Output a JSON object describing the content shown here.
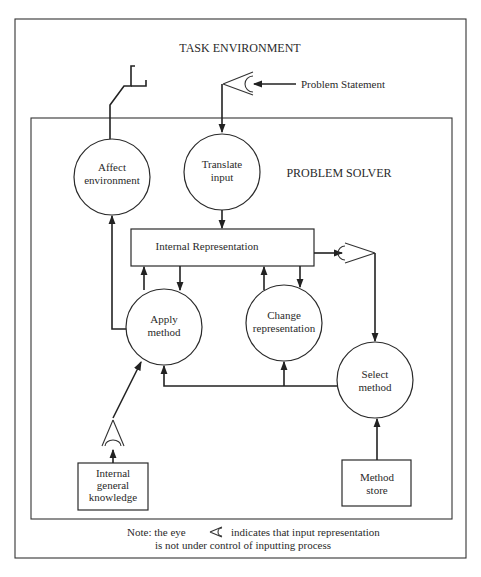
{
  "diagram": {
    "outer_label": "TASK ENVIRONMENT",
    "inner_label": "PROBLEM SOLVER",
    "input_label": "Problem Statement",
    "nodes": {
      "affect": {
        "line1": "Affect",
        "line2": "environment"
      },
      "translate": {
        "line1": "Translate",
        "line2": "input"
      },
      "internal_rep": {
        "label": "Internal Representation"
      },
      "apply": {
        "line1": "Apply",
        "line2": "method"
      },
      "change": {
        "line1": "Change",
        "line2": "representation"
      },
      "select": {
        "line1": "Select",
        "line2": "method"
      },
      "knowledge": {
        "line1": "Internal",
        "line2": "general",
        "line3": "knowledge"
      },
      "store": {
        "line1": "Method",
        "line2": "store"
      }
    },
    "edges": [
      {
        "from": "Problem Statement",
        "to": "eye (top)"
      },
      {
        "from": "eye (top)",
        "to": "Translate input"
      },
      {
        "from": "Translate input",
        "to": "Internal Representation"
      },
      {
        "from": "Internal Representation",
        "to": "Apply method"
      },
      {
        "from": "Apply method",
        "to": "Internal Representation"
      },
      {
        "from": "Internal Representation",
        "to": "Change representation"
      },
      {
        "from": "Change representation",
        "to": "Internal Representation"
      },
      {
        "from": "Internal Representation",
        "to": "eye (right)"
      },
      {
        "from": "eye (right)",
        "to": "Select method"
      },
      {
        "from": "Select method",
        "to": "Apply method"
      },
      {
        "from": "Select method",
        "to": "Change representation"
      },
      {
        "from": "Method store",
        "to": "Select method"
      },
      {
        "from": "Internal general knowledge",
        "to": "eye (bottom-left)"
      },
      {
        "from": "eye (bottom-left)",
        "to": "Apply method"
      },
      {
        "from": "Apply method",
        "to": "Affect environment"
      },
      {
        "from": "Affect environment",
        "to": "Task environment (effector)"
      }
    ],
    "note": {
      "prefix": "Note: the eye",
      "suffix": "indicates that input representation",
      "line2": "is not under control of inputting process",
      "icon": "eye-icon"
    }
  }
}
